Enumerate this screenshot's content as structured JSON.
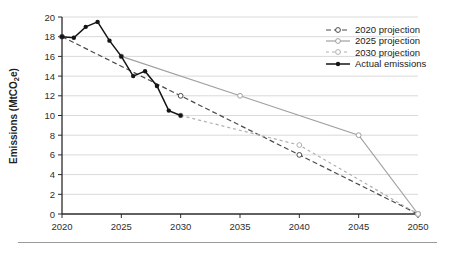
{
  "chart_data": {
    "type": "line",
    "title": "",
    "xlabel": "",
    "ylabel": "Emissions (MtCO2e)",
    "ylabel_parts": {
      "pre": "Emissions (MtCO",
      "sub": "2",
      "post": "e)"
    },
    "axes": {
      "x": {
        "min": 2020,
        "max": 2050,
        "ticks": [
          2020,
          2025,
          2030,
          2035,
          2040,
          2045,
          2050
        ]
      },
      "y": {
        "min": 0,
        "max": 20,
        "ticks": [
          0,
          2,
          4,
          6,
          8,
          10,
          12,
          14,
          16,
          18,
          20
        ]
      }
    },
    "grid": "horizontal",
    "legend_position": "top-right",
    "series": [
      {
        "name": "2020 projection",
        "x": [
          2020,
          2030,
          2040,
          2050
        ],
        "y": [
          18,
          12,
          6,
          0
        ],
        "color": "#4a4a4a",
        "dash": "5 3",
        "marker": "open-circle",
        "width": 1.2
      },
      {
        "name": "2025 projection",
        "x": [
          2025,
          2035,
          2045,
          2050
        ],
        "y": [
          16,
          12,
          8,
          0
        ],
        "color": "#a0a0a0",
        "dash": "",
        "marker": "open-circle",
        "width": 1.2
      },
      {
        "name": "2030 projection",
        "x": [
          2030,
          2040,
          2050
        ],
        "y": [
          10,
          7,
          0
        ],
        "color": "#b0b0b0",
        "dash": "3 3",
        "marker": "open-circle",
        "width": 1.2
      },
      {
        "name": "Actual emissions",
        "x": [
          2020,
          2021,
          2022,
          2023,
          2024,
          2025,
          2026,
          2027,
          2028,
          2029,
          2030
        ],
        "y": [
          18,
          17.9,
          19,
          19.5,
          17.6,
          16,
          14,
          14.5,
          13,
          10.5,
          10
        ],
        "color": "#141414",
        "dash": "",
        "marker": "filled-circle",
        "width": 1.5
      }
    ],
    "colors": {
      "grid": "#d9d9d9",
      "axis": "#2b2b2b",
      "tick_label": "#2e2e2e",
      "ylabel_text": "#1f1f1f",
      "legend_text": "#1a1a1a",
      "rule": "#9a9a9a",
      "background": "#ffffff"
    }
  }
}
